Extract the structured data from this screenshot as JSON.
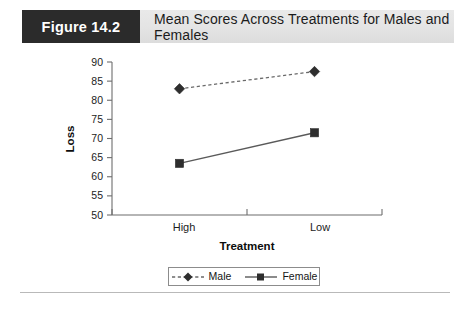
{
  "header": {
    "badge": "Figure 14.2",
    "title": "Mean Scores Across Treatments for Males and Females"
  },
  "legend": {
    "male_label": "Male",
    "female_label": "Female"
  },
  "axes": {
    "y_ticks": [
      "90",
      "85",
      "80",
      "75",
      "70",
      "65",
      "60",
      "55",
      "50"
    ],
    "x_ticks": [
      "High",
      "Low"
    ],
    "ylabel": "Loss",
    "xlabel": "Treatment"
  },
  "chart_data": {
    "type": "line",
    "title": "Mean Scores Across Treatments for Males and Females",
    "xlabel": "Treatment",
    "ylabel": "Loss",
    "categories": [
      "High",
      "Low"
    ],
    "series": [
      {
        "name": "Male",
        "values": [
          83,
          87.5
        ],
        "marker": "diamond",
        "linestyle": "dashed",
        "color": "#2e2e2e"
      },
      {
        "name": "Female",
        "values": [
          63.5,
          71.5
        ],
        "marker": "square",
        "linestyle": "solid",
        "color": "#2e2e2e"
      }
    ],
    "ylim": [
      50,
      90
    ],
    "ytick_step": 5,
    "grid": false,
    "legend_position": "bottom-center"
  }
}
